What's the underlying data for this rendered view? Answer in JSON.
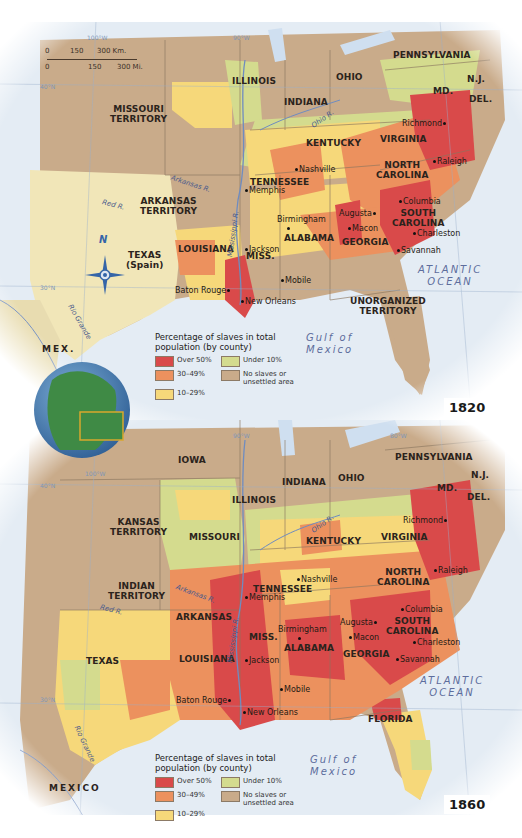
{
  "legend": {
    "title_line1": "Percentage of slaves in total",
    "title_line2": "population (by county)",
    "items": [
      {
        "label": "Over 50%",
        "color": "#d94a4a"
      },
      {
        "label": "Under 10%",
        "color": "#d4db8e"
      },
      {
        "label": "30–49%",
        "color": "#ec915e"
      },
      {
        "label": "No slaves or unsettled area",
        "label1": "No slaves or",
        "label2": "unsettled area",
        "color": "#c9ab8a"
      },
      {
        "label": "10–29%",
        "color": "#f6d87a"
      }
    ]
  },
  "colors": {
    "over50": "#d94a4a",
    "p30_49": "#ec915e",
    "p10_29": "#f6d87a",
    "under10": "#d4db8e",
    "none": "#c9ab8a",
    "texas_spain": "#f1e6b8",
    "water": "#dbe6f2",
    "globe": "#3f8a45"
  },
  "scale_bar": {
    "km": [
      "0",
      "150",
      "300 Km."
    ],
    "mi": [
      "0",
      "150",
      "300 Mi."
    ]
  },
  "map1820": {
    "year": "1820",
    "gridlines": {
      "lon100": "100°W",
      "lon90": "90°W",
      "lon80": "80°W",
      "lat40": "40°N",
      "lat30": "30°N"
    },
    "regions": {
      "missouri_territory": [
        "MISSOURI",
        "TERRITORY"
      ],
      "illinois": "ILLINOIS",
      "indiana": "INDIANA",
      "ohio": "OHIO",
      "pennsylvania": "PENNSYLVANIA",
      "nj": "N.J.",
      "md": "MD.",
      "del": "DEL.",
      "virginia": "VIRGINIA",
      "kentucky": "KENTUCKY",
      "tennessee": "TENNESSEE",
      "north_carolina": [
        "NORTH",
        "CAROLINA"
      ],
      "south_carolina": [
        "SOUTH",
        "CAROLINA"
      ],
      "arkansas_territory": [
        "ARKANSAS",
        "TERRITORY"
      ],
      "texas": [
        "TEXAS",
        "(Spain)"
      ],
      "louisiana": "LOUISIANA",
      "miss": "MISS.",
      "alabama": "ALABAMA",
      "georgia": "GEORGIA",
      "unorganized_territory": [
        "UNORGANIZED",
        "TERRITORY"
      ],
      "mex": "MEX."
    },
    "cities": {
      "richmond": "Richmond",
      "raleigh": "Raleigh",
      "nashville": "Nashville",
      "memphis": "Memphis",
      "columbia": "Columbia",
      "augusta": "Augusta",
      "macon": "Macon",
      "charleston": "Charleston",
      "savannah": "Savannah",
      "birmingham": "Birmingham",
      "jackson": "Jackson",
      "mobile": "Mobile",
      "baton_rouge": "Baton Rouge",
      "new_orleans": "New Orleans"
    },
    "rivers": {
      "ohio": "Ohio R.",
      "arkansas": "Arkansas R.",
      "red": "Red R.",
      "mississippi": "Mississippi R.",
      "rio_grande": "Rio Grande"
    },
    "water": {
      "atlantic": [
        "ATLANTIC",
        "OCEAN"
      ],
      "gulf": [
        "Gulf of",
        "Mexico"
      ]
    },
    "compass": "N"
  },
  "map1860": {
    "year": "1860",
    "gridlines": {
      "lon100": "100°W",
      "lon90": "90°W",
      "lon80": "80°W",
      "lat40": "40°N",
      "lat30": "30°N"
    },
    "regions": {
      "iowa": "IOWA",
      "illinois": "ILLINOIS",
      "indiana": "INDIANA",
      "ohio": "OHIO",
      "pennsylvania": "PENNSYLVANIA",
      "nj": "N.J.",
      "md": "MD.",
      "del": "DEL.",
      "kansas_territory": [
        "KANSAS",
        "TERRITORY"
      ],
      "missouri": "MISSOURI",
      "kentucky": "KENTUCKY",
      "virginia": "VIRGINIA",
      "indian_territory": [
        "INDIAN",
        "TERRITORY"
      ],
      "tennessee": "TENNESSEE",
      "north_carolina": [
        "NORTH",
        "CAROLINA"
      ],
      "arkansas": "ARKANSAS",
      "miss": "MISS.",
      "alabama": "ALABAMA",
      "georgia": "GEORGIA",
      "south_carolina": [
        "SOUTH",
        "CAROLINA"
      ],
      "texas": "TEXAS",
      "louisiana": "LOUISIANA",
      "florida": "FLORIDA",
      "mexico": "MEXICO"
    },
    "cities": {
      "richmond": "Richmond",
      "raleigh": "Raleigh",
      "nashville": "Nashville",
      "memphis": "Memphis",
      "columbia": "Columbia",
      "augusta": "Augusta",
      "macon": "Macon",
      "charleston": "Charleston",
      "savannah": "Savannah",
      "birmingham": "Birmingham",
      "jackson": "Jackson",
      "mobile": "Mobile",
      "baton_rouge": "Baton Rouge",
      "new_orleans": "New Orleans"
    },
    "rivers": {
      "ohio": "Ohio R.",
      "arkansas": "Arkansas R.",
      "red": "Red R.",
      "mississippi": "Mississippi R.",
      "rio_grande": "Rio Grande"
    },
    "water": {
      "atlantic": [
        "ATLANTIC",
        "OCEAN"
      ],
      "gulf": [
        "Gulf of",
        "Mexico"
      ]
    }
  }
}
